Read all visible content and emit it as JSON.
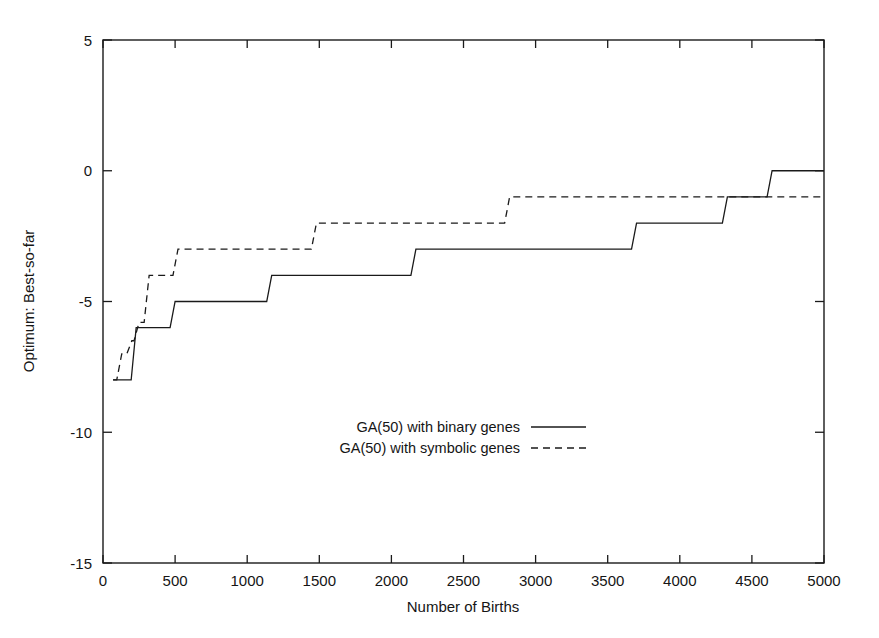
{
  "chart_data": {
    "type": "line",
    "title": "",
    "subtitle": "",
    "xlabel": "Number of Births",
    "ylabel": "Optimum: Best-so-far",
    "xlim": [
      0,
      5000
    ],
    "ylim": [
      -15,
      5
    ],
    "xticks": [
      0,
      500,
      1000,
      1500,
      2000,
      2500,
      3000,
      3500,
      4000,
      4500,
      5000
    ],
    "xtick_labels": [
      "0",
      "500",
      "1000",
      "1500",
      "2000",
      "2500",
      "3000",
      "3500",
      "4000",
      "4500",
      "5000"
    ],
    "yticks": [
      5,
      0,
      -5,
      -10,
      -15
    ],
    "ytick_labels": [
      "5",
      "0",
      "-5",
      "-10",
      "-15"
    ],
    "grid": false,
    "legend_position": "center",
    "step_style": "post",
    "series": [
      {
        "name": "GA(50) with binary genes",
        "style": "solid",
        "color": "#1a1a1a",
        "x": [
          70,
          230,
          500,
          1170,
          2170,
          3700,
          4330,
          4640,
          5000
        ],
        "y": [
          -8,
          -6,
          -5,
          -4,
          -3,
          -2,
          -1,
          0,
          0
        ]
      },
      {
        "name": "GA(50) with symbolic genes",
        "style": "dashed",
        "color": "#1a1a1a",
        "x": [
          70,
          130,
          200,
          250,
          320,
          520,
          1480,
          2820,
          5000
        ],
        "y": [
          -8,
          -7,
          -6.5,
          -5.8,
          -4,
          -3,
          -2,
          -1,
          -1
        ]
      }
    ]
  },
  "legend": {
    "entries": [
      {
        "label": "GA(50) with binary genes",
        "style": "solid"
      },
      {
        "label": "GA(50) with symbolic genes",
        "style": "dashed"
      }
    ]
  },
  "axes": {
    "x_title": "Number of Births",
    "y_title": "Optimum: Best-so-far"
  }
}
